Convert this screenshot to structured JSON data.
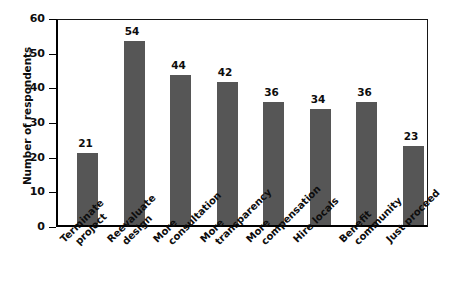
{
  "chart_data": {
    "type": "bar",
    "title": "",
    "xlabel": "",
    "ylabel": "Number of respondents",
    "ylim": [
      0,
      60
    ],
    "yticks": [
      0,
      10,
      20,
      30,
      40,
      50,
      60
    ],
    "grid": false,
    "legend": null,
    "bar_color": "#565656",
    "axis_color": "#000000",
    "categories": [
      "Terminate project",
      "Reevaluate design",
      "More consultation",
      "More transparency",
      "More compensation",
      "Hire locals",
      "Benefit community",
      "Just proceed"
    ],
    "category_lines": [
      [
        "Terminate",
        "project"
      ],
      [
        "Reevaluate",
        "design"
      ],
      [
        "More",
        "consultation"
      ],
      [
        "More",
        "transparency"
      ],
      [
        "More",
        "compensation"
      ],
      [
        "Hire locals",
        ""
      ],
      [
        "Benefit",
        "community"
      ],
      [
        "Just proceed",
        ""
      ]
    ],
    "values": [
      21,
      54,
      44,
      42,
      36,
      34,
      36,
      23
    ],
    "value_labels": [
      "21",
      "54",
      "44",
      "42",
      "36",
      "34",
      "36",
      "23"
    ],
    "ytick_labels": [
      "0",
      "10",
      "20",
      "30",
      "40",
      "50",
      "60"
    ]
  }
}
